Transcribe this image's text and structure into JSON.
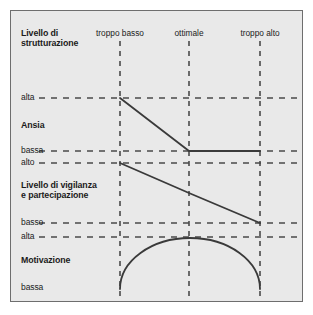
{
  "figure": {
    "title": "",
    "background_color": "#e9e9e9",
    "border_color": "#6e6e6e",
    "line_color": "#3a3a3a",
    "dash_color": "#4a4a4a",
    "text_color": "#1b1b1b"
  },
  "column_headers": [
    {
      "label": "troppo basso",
      "x": 119
    },
    {
      "label": "ottimale",
      "x": 188
    },
    {
      "label": "troppo alto",
      "x": 259
    }
  ],
  "panels": [
    {
      "name": "strutturazione",
      "title_lines": [
        "Livello di",
        "strutturazione"
      ],
      "axis_top_label": "",
      "axis_bottom_label": ""
    },
    {
      "name": "ansia",
      "title_lines": [
        "Ansia"
      ],
      "axis_top_label": "alta",
      "axis_bottom_label": "bassa"
    },
    {
      "name": "vigilanza",
      "title_lines": [
        "Livello di vigilanza",
        "e partecipazione"
      ],
      "axis_top_label": "alto",
      "axis_bottom_label": "basso"
    },
    {
      "name": "motivazione",
      "title_lines": [
        "Motivazione"
      ],
      "axis_top_label": "alta",
      "axis_bottom_label": "bassa"
    }
  ],
  "chart_data": {
    "type": "line",
    "title": "",
    "xlabel": "Livello di strutturazione",
    "ylabel": "",
    "categories": [
      "troppo basso",
      "ottimale",
      "troppo alto"
    ],
    "x": [
      119,
      188,
      259
    ],
    "grid": true,
    "legend": "none",
    "series": [
      {
        "name": "Ansia",
        "shape": "descending-then-flat",
        "ylabels": [
          "alta",
          "bassa"
        ],
        "values": [
          "alta",
          "bassa",
          "bassa"
        ],
        "points": [
          [
            119,
            97
          ],
          [
            188,
            150
          ],
          [
            259,
            150
          ]
        ],
        "y_top": 97,
        "y_bottom": 150
      },
      {
        "name": "Livello di vigilanza e partecipazione",
        "shape": "linear-descending",
        "ylabels": [
          "alto",
          "basso"
        ],
        "values": [
          "alto",
          "medio",
          "basso"
        ],
        "points": [
          [
            119,
            162
          ],
          [
            188,
            192
          ],
          [
            259,
            222
          ]
        ],
        "y_top": 162,
        "y_bottom": 222
      },
      {
        "name": "Motivazione",
        "shape": "inverted-u-arc",
        "ylabels": [
          "alta",
          "bassa"
        ],
        "values": [
          "bassa",
          "alta",
          "bassa"
        ],
        "points": [
          [
            119,
            288
          ],
          [
            188,
            237
          ],
          [
            259,
            288
          ]
        ],
        "y_top": 237,
        "y_bottom": 288
      }
    ],
    "gridlines_horizontal": [
      {
        "label": "alta",
        "panel": "ansia",
        "y": 97
      },
      {
        "label": "bassa",
        "panel": "ansia",
        "y": 150
      },
      {
        "label": "alto",
        "panel": "vigilanza",
        "y": 162
      },
      {
        "label": "basso",
        "panel": "vigilanza",
        "y": 222
      },
      {
        "label": "alta",
        "panel": "motivazione",
        "y": 236
      }
    ],
    "gridlines_vertical": [
      {
        "label": "troppo basso",
        "x": 119
      },
      {
        "label": "ottimale",
        "x": 188
      },
      {
        "label": "troppo alto",
        "x": 259
      }
    ]
  }
}
